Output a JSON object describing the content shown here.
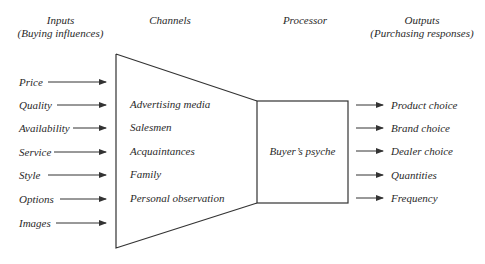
{
  "headers": {
    "inputs": {
      "title": "Inputs",
      "subtitle": "(Buying influences)"
    },
    "channels": {
      "title": "Channels"
    },
    "processor": {
      "title": "Processor"
    },
    "outputs": {
      "title": "Outputs",
      "subtitle": "(Purchasing responses)"
    }
  },
  "inputs": [
    "Price",
    "Quality",
    "Availability",
    "Service",
    "Style",
    "Options",
    "Images"
  ],
  "channels": [
    "Advertising media",
    "Salesmen",
    "Acquaintances",
    "Family",
    "Personal observation"
  ],
  "processor": {
    "label": "Buyer’s psyche"
  },
  "outputs": [
    "Product choice",
    "Brand choice",
    "Dealer choice",
    "Quantities",
    "Frequency"
  ],
  "colors": {
    "line": "#333333",
    "text": "#2a2a2a",
    "background": "#ffffff"
  }
}
